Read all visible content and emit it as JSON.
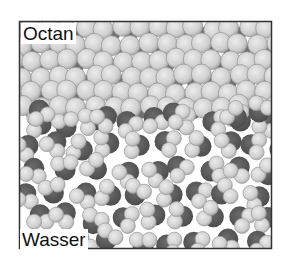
{
  "figure": {
    "box": {
      "x": 19.5,
      "y": 21.5,
      "width": 252,
      "height": 227,
      "stroke": "#333333"
    },
    "labels": {
      "top": "Octan",
      "bottom": "Wasser"
    },
    "colors": {
      "carbon": "#6e6e6e",
      "hydrogen_fill": "#d4d4d4",
      "hydrogen_edge": "#9a9a9a",
      "oxygen": "#5a5a5a",
      "background": "#ffffff"
    },
    "phases": [
      {
        "name": "octane",
        "region": "top",
        "y_range": [
          21,
          115
        ]
      },
      {
        "name": "water",
        "region": "bottom",
        "y_range": [
          105,
          249
        ]
      }
    ]
  }
}
